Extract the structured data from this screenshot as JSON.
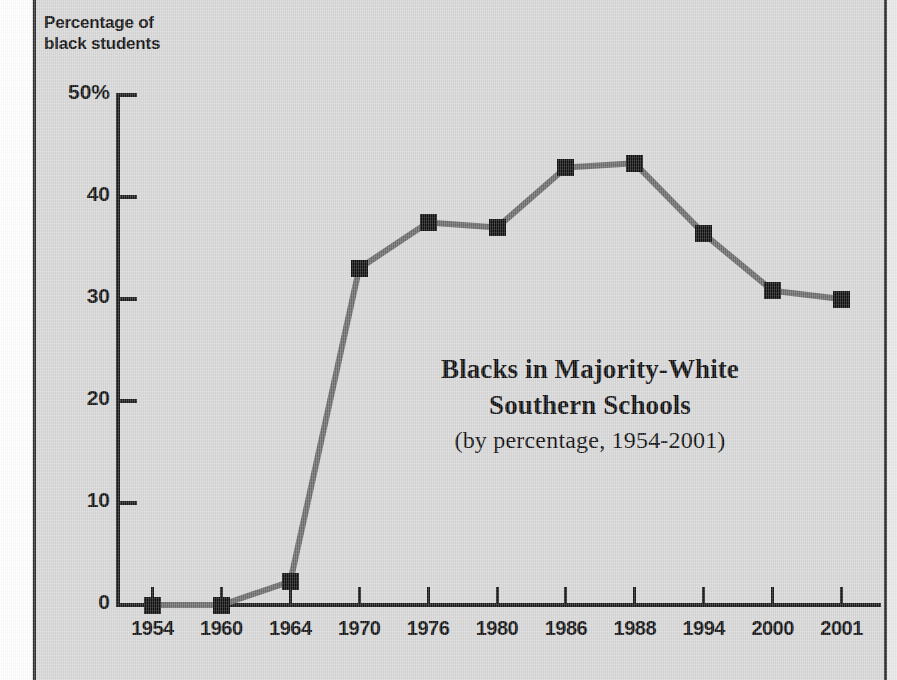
{
  "figure": {
    "y_axis_caption_line1": "Percentage of",
    "y_axis_caption_line2": "black students",
    "title_line1": "Blacks in Majority-White",
    "title_line2": "Southern Schools",
    "subtitle": "(by percentage, 1954-2001)"
  },
  "chart_data": {
    "type": "line",
    "title": "Blacks in Majority-White Southern Schools",
    "subtitle": "(by percentage, 1954-2001)",
    "xlabel": "",
    "ylabel": "Percentage of black students",
    "categories": [
      "1954",
      "1960",
      "1964",
      "1970",
      "1976",
      "1980",
      "1986",
      "1988",
      "1994",
      "2000",
      "2001"
    ],
    "values": [
      0.0,
      0.0,
      2.3,
      33.0,
      37.5,
      37.0,
      42.9,
      43.3,
      36.4,
      30.8,
      30.0
    ],
    "ytick_labels": [
      "0",
      "10",
      "20",
      "30",
      "40",
      "50%"
    ],
    "ytick_values": [
      0,
      10,
      20,
      30,
      40,
      50
    ],
    "ylim": [
      0,
      50
    ],
    "grid": false,
    "legend": false,
    "marker": "square",
    "marker_color": "#101010",
    "line_color": "#6b6b6b",
    "background_color": "#d7d7d7"
  }
}
